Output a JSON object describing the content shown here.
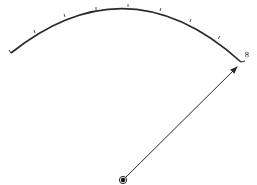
{
  "diagram": {
    "arc": {
      "start": [
        11,
        53
      ],
      "end": [
        241,
        62
      ],
      "control_top": [
        128,
        7
      ],
      "stroke_color": "#2a2a2a",
      "tick_count": 7
    },
    "ticks": [
      [
        35,
        33
      ],
      [
        65,
        17
      ],
      [
        96,
        9
      ],
      [
        128,
        7
      ],
      [
        160,
        12
      ],
      [
        190,
        23
      ],
      [
        218,
        40
      ]
    ],
    "end_label": "∞",
    "arrow": {
      "from": [
        123,
        180
      ],
      "to": [
        237,
        67
      ],
      "color": "#2a2a2a"
    },
    "center_dot": {
      "cx": 123,
      "cy": 180,
      "r": 3
    }
  }
}
